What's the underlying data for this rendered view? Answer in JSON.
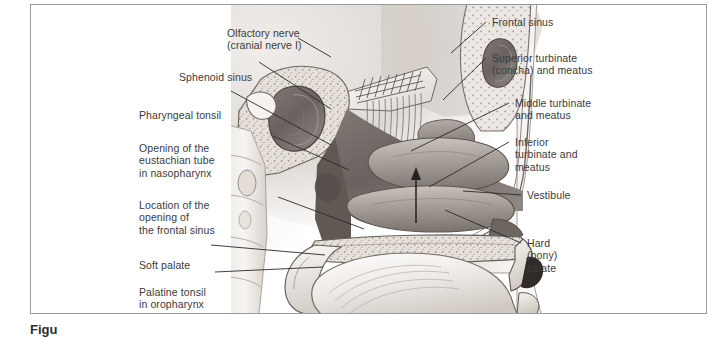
{
  "figure": {
    "kind": "anatomical-illustration",
    "style": "grayscale medical illustration",
    "caption_partial": "Figu"
  },
  "labels_left": [
    {
      "id": "olfactory-nerve",
      "text": "Olfactory nerve\n(cranial nerve I)"
    },
    {
      "id": "sphenoid-sinus",
      "text": "Sphenoid sinus"
    },
    {
      "id": "pharyngeal-tonsil",
      "text": "Pharyngeal tonsil"
    },
    {
      "id": "eustachian-tube",
      "text": "Opening of the\neustachian tube\nin nasopharynx"
    },
    {
      "id": "frontal-sinus-opening",
      "text": "Location of the\nopening of\nthe frontal sinus"
    },
    {
      "id": "soft-palate",
      "text": "Soft palate"
    },
    {
      "id": "palatine-tonsil",
      "text": "Palatine tonsil\nin oropharynx"
    }
  ],
  "labels_right": [
    {
      "id": "frontal-sinus",
      "text": "Frontal sinus"
    },
    {
      "id": "superior-turbinate",
      "text": "Superior turbinate\n(concha) and meatus"
    },
    {
      "id": "middle-turbinate",
      "text": "Middle turbinate\nand meatus"
    },
    {
      "id": "inferior-turbinate",
      "text": "Inferior\nturbinate and\nmeatus"
    },
    {
      "id": "vestibule",
      "text": "Vestibule"
    },
    {
      "id": "hard-palate",
      "text": "Hard\n(bony)\npalate"
    }
  ],
  "colors": {
    "frame_border": "#9a9a9a",
    "label_text": "#3b3b3b",
    "leader_line": "#2a2a2a",
    "page_background": "#ffffff",
    "plate_light": "#f2f0ee",
    "plate_mid": "#b8b3ad",
    "plate_dark": "#5d5954",
    "mucosa_dark": "#6e6560"
  }
}
